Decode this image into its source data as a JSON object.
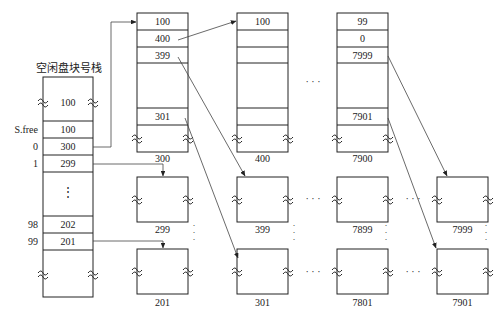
{
  "title": "空闲盘块号栈",
  "stack": {
    "top_value": "100",
    "rows": [
      {
        "index": "S.free",
        "value": "100"
      },
      {
        "index": "0",
        "value": "300"
      },
      {
        "index": "1",
        "value": "299"
      },
      {
        "index": "",
        "value": "⋮"
      },
      {
        "index": "98",
        "value": "202"
      },
      {
        "index": "99",
        "value": "201"
      }
    ]
  },
  "groups": [
    {
      "cells": [
        "100",
        "400",
        "399",
        "",
        "301"
      ],
      "label": "300"
    },
    {
      "cells": [
        "100",
        "",
        "",
        "",
        ""
      ],
      "label": "400"
    },
    {
      "cells": [
        "99",
        "0",
        "7999",
        "",
        "7901"
      ],
      "label": "7900"
    }
  ],
  "blocks": [
    {
      "label": "299"
    },
    {
      "label": "201"
    },
    {
      "label": "399"
    },
    {
      "label": "301"
    },
    {
      "label": "7899"
    },
    {
      "label": "7801"
    },
    {
      "label": "7999"
    },
    {
      "label": "7901"
    }
  ],
  "ellipsis": "· · ·"
}
